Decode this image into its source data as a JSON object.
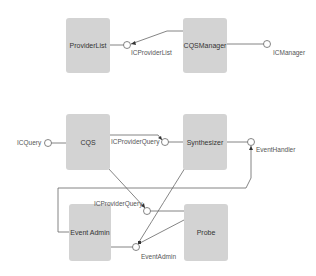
{
  "diagram": {
    "type": "component-diagram",
    "colors": {
      "background": "#ffffff",
      "component_fill": "#d3d3d3",
      "line": "#666666",
      "text": "#333333"
    },
    "components": [
      {
        "id": "providerlist",
        "label": "ProviderList"
      },
      {
        "id": "cqsmanager",
        "label": "CQSManager"
      },
      {
        "id": "cqs",
        "label": "CQS"
      },
      {
        "id": "synthesizer",
        "label": "Synthesizer"
      },
      {
        "id": "eventadmin",
        "label": "Event Admin"
      },
      {
        "id": "probe",
        "label": "Probe"
      }
    ],
    "interfaces": [
      {
        "id": "icproviderlist",
        "label": "ICProviderList",
        "provided_by": "providerlist",
        "required_by": [
          "cqsmanager"
        ]
      },
      {
        "id": "icmanager",
        "label": "ICManager",
        "provided_by": "cqsmanager",
        "required_by": []
      },
      {
        "id": "icquery",
        "label": "ICQuery",
        "provided_by": "cqs",
        "required_by": []
      },
      {
        "id": "icproviderquery_1",
        "label": "ICProviderQuery",
        "provided_by": "synthesizer",
        "required_by": [
          "cqs"
        ]
      },
      {
        "id": "eventhandler",
        "label": "EventHandler",
        "provided_by": "synthesizer",
        "required_by": [
          "eventadmin"
        ]
      },
      {
        "id": "icproviderquery_2",
        "label": "ICProviderQuery",
        "provided_by": "probe",
        "required_by": [
          "cqs"
        ]
      },
      {
        "id": "eventadmin_if",
        "label": "EventAdmin",
        "provided_by": "eventadmin",
        "required_by": [
          "synthesizer",
          "probe"
        ]
      }
    ]
  }
}
